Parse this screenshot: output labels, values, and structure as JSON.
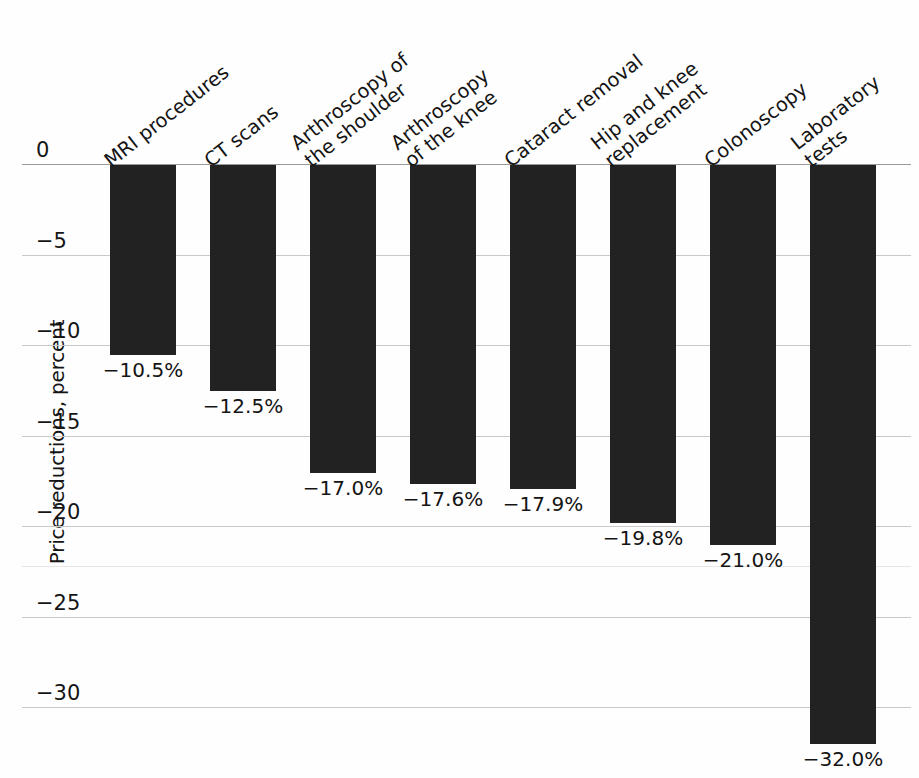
{
  "chart_data": {
    "type": "bar",
    "title": "",
    "subtitle": "",
    "xlabel": "",
    "ylabel": "Price reductions, percent",
    "ylim": [
      -33.5,
      0
    ],
    "yticks": [
      0,
      -5,
      -10,
      -15,
      -20,
      -25,
      -30
    ],
    "ytick_labels": [
      "0",
      "−5",
      "−10",
      "−15",
      "−20",
      "−25",
      "−30"
    ],
    "grid": true,
    "legend": "none",
    "bar_color": "#222222",
    "gridline_color": "#c9c9c9",
    "categories": [
      "MRI procedures",
      "CT scans",
      "Arthroscopy of\nthe shoulder",
      "Arthroscopy\nof the knee",
      "Cataract removal",
      "Hip and knee\nreplacement",
      "Colonoscopy",
      "Laboratory\ntests"
    ],
    "values": [
      -10.5,
      -12.5,
      -17.0,
      -17.6,
      -17.9,
      -19.8,
      -21.0,
      -32.0
    ],
    "data_labels": [
      "−10.5%",
      "−12.5%",
      "−17.0%",
      "−17.6%",
      "−17.9%",
      "−19.8%",
      "−21.0%",
      "−32.0%"
    ]
  }
}
